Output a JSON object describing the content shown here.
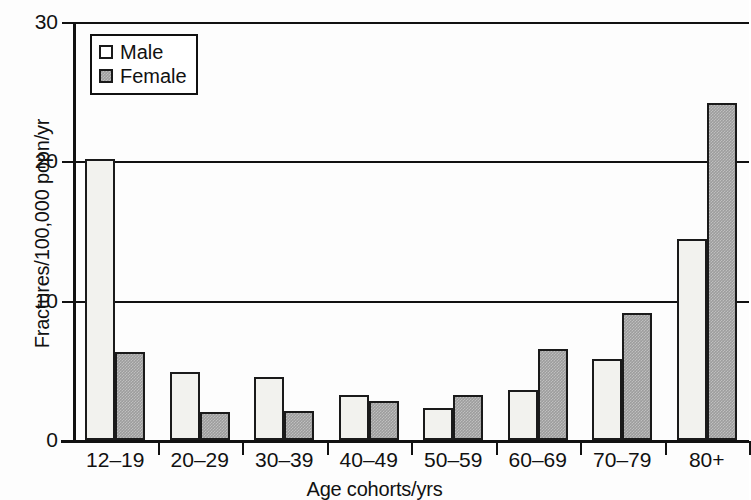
{
  "chart_data": {
    "type": "bar",
    "title": "",
    "xlabel": "Age cohorts/yrs",
    "ylabel": "Fractures/100,000 popn/yr",
    "categories": [
      "12–19",
      "20–29",
      "30–39",
      "40–49",
      "50–59",
      "60–69",
      "70–79",
      "80+"
    ],
    "series": [
      {
        "name": "Male",
        "color": "#f2f2ee",
        "values": [
          20.2,
          4.9,
          4.5,
          3.2,
          2.3,
          3.6,
          5.8,
          14.4
        ]
      },
      {
        "name": "Female",
        "color": "#9d9d9d",
        "values": [
          6.3,
          2.0,
          2.1,
          2.8,
          3.2,
          6.5,
          9.1,
          24.2
        ]
      }
    ],
    "ylim": [
      0,
      30
    ],
    "yticks": [
      0,
      10,
      20,
      30
    ],
    "ytick_labels": [
      "0",
      "10",
      "20",
      "30"
    ],
    "grid": "horizontal",
    "legend_position": "top-left",
    "legend_entries": [
      "Male",
      "Female"
    ]
  }
}
